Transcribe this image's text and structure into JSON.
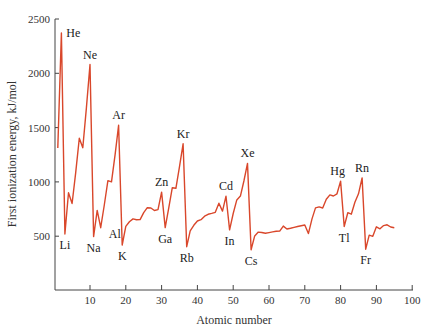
{
  "chart_data": {
    "type": "line",
    "title": "",
    "xlabel": "Atomic number",
    "ylabel": "First ionization energy, kJ/mol",
    "xlim": [
      0,
      100
    ],
    "ylim": [
      0,
      2500
    ],
    "x_ticks": [
      10,
      20,
      30,
      40,
      50,
      60,
      70,
      80,
      90,
      100
    ],
    "y_ticks": [
      500,
      1000,
      1500,
      2000,
      2500
    ],
    "grid": false,
    "legend": null,
    "line_color": "#d9472b",
    "series": [
      {
        "name": "First ionization energy",
        "x": [
          1,
          2,
          3,
          4,
          5,
          6,
          7,
          8,
          9,
          10,
          11,
          12,
          13,
          14,
          15,
          16,
          17,
          18,
          19,
          20,
          21,
          22,
          23,
          24,
          25,
          26,
          27,
          28,
          29,
          30,
          31,
          32,
          33,
          34,
          35,
          36,
          37,
          38,
          39,
          40,
          41,
          42,
          43,
          44,
          45,
          46,
          47,
          48,
          49,
          50,
          51,
          52,
          53,
          54,
          55,
          56,
          57,
          58,
          59,
          60,
          61,
          62,
          63,
          64,
          65,
          66,
          67,
          68,
          69,
          70,
          71,
          72,
          73,
          74,
          75,
          76,
          77,
          78,
          79,
          80,
          81,
          82,
          83,
          84,
          85,
          86,
          87,
          88,
          89,
          90,
          91,
          92,
          93,
          94,
          95
        ],
        "values": [
          1312,
          2372,
          520,
          900,
          801,
          1086,
          1402,
          1314,
          1681,
          2081,
          496,
          738,
          578,
          787,
          1012,
          1000,
          1251,
          1521,
          419,
          590,
          633,
          659,
          651,
          653,
          717,
          762,
          760,
          737,
          745,
          906,
          579,
          762,
          947,
          941,
          1140,
          1351,
          403,
          550,
          600,
          640,
          652,
          684,
          702,
          710,
          720,
          804,
          731,
          868,
          558,
          709,
          834,
          869,
          1008,
          1170,
          376,
          503,
          538,
          534,
          527,
          533,
          540,
          545,
          547,
          593,
          566,
          573,
          581,
          589,
          597,
          603,
          524,
          659,
          761,
          770,
          760,
          840,
          880,
          870,
          890,
          1007,
          589,
          716,
          703,
          812,
          890,
          1037,
          380,
          509,
          499,
          587,
          568,
          598,
          605,
          585,
          578
        ]
      }
    ],
    "annotations": [
      {
        "label": "He",
        "x": 2,
        "y": 2372,
        "pos": "right-above"
      },
      {
        "label": "Ne",
        "x": 10,
        "y": 2081,
        "pos": "above"
      },
      {
        "label": "Ar",
        "x": 18,
        "y": 1521,
        "pos": "above"
      },
      {
        "label": "Kr",
        "x": 36,
        "y": 1351,
        "pos": "above"
      },
      {
        "label": "Xe",
        "x": 54,
        "y": 1170,
        "pos": "above"
      },
      {
        "label": "Rn",
        "x": 86,
        "y": 1037,
        "pos": "above"
      },
      {
        "label": "Zn",
        "x": 30,
        "y": 906,
        "pos": "above"
      },
      {
        "label": "Cd",
        "x": 48,
        "y": 868,
        "pos": "above"
      },
      {
        "label": "Hg",
        "x": 80,
        "y": 1007,
        "pos": "above-left"
      },
      {
        "label": "Li",
        "x": 3,
        "y": 520,
        "pos": "below"
      },
      {
        "label": "Na",
        "x": 11,
        "y": 496,
        "pos": "below"
      },
      {
        "label": "Al",
        "x": 13,
        "y": 578,
        "pos": "below-right"
      },
      {
        "label": "K",
        "x": 19,
        "y": 419,
        "pos": "below"
      },
      {
        "label": "Ga",
        "x": 31,
        "y": 579,
        "pos": "below"
      },
      {
        "label": "Rb",
        "x": 37,
        "y": 403,
        "pos": "below"
      },
      {
        "label": "In",
        "x": 49,
        "y": 558,
        "pos": "below"
      },
      {
        "label": "Cs",
        "x": 55,
        "y": 376,
        "pos": "below"
      },
      {
        "label": "Tl",
        "x": 81,
        "y": 589,
        "pos": "below"
      },
      {
        "label": "Fr",
        "x": 87,
        "y": 380,
        "pos": "below"
      }
    ]
  }
}
